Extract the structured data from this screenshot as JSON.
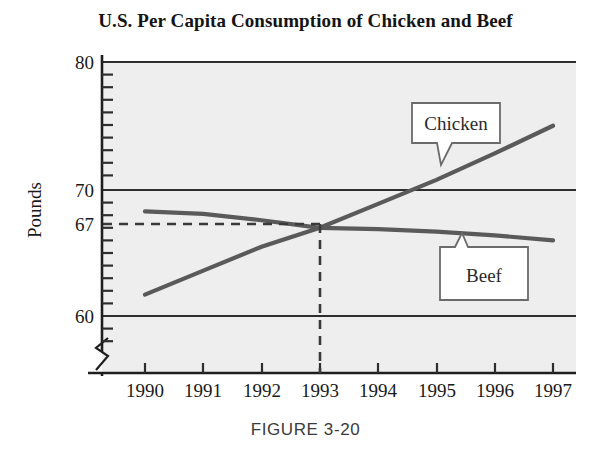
{
  "figure": {
    "title": "U.S. Per Capita Consumption of Chicken and Beef",
    "caption": "FIGURE 3-20"
  },
  "colors": {
    "line": "#5a5a5a",
    "axis": "#1f1f1f",
    "grid": "#3a3a3a",
    "plot_background": "#eeeeee",
    "callout_fill": "#ffffff",
    "callout_border": "#6b6b6b",
    "text": "#1a1a1a"
  },
  "chart_data": {
    "type": "line",
    "title": "U.S. Per Capita Consumption of Chicken and Beef",
    "xlabel": "",
    "ylabel": "Pounds",
    "x": [
      1990,
      1991,
      1992,
      1993,
      1994,
      1995,
      1996,
      1997
    ],
    "xticklabels": [
      "1990",
      "1991",
      "1992",
      "1993",
      "1994",
      "1995",
      "1996",
      "1997"
    ],
    "yticks": [
      60,
      67,
      70,
      80
    ],
    "yticklabels": [
      "60",
      "67",
      "70",
      "80"
    ],
    "ylim": [
      57,
      80
    ],
    "xlim": [
      1989.4,
      1997.6
    ],
    "grid": "horizontal",
    "gridlines": [
      60,
      70,
      80
    ],
    "minor_y_ticks": 1,
    "axis_break": true,
    "legend": "callouts",
    "series": [
      {
        "name": "Chicken",
        "values": [
          61.7,
          63.6,
          65.5,
          67.0,
          68.9,
          70.8,
          72.9,
          75.1
        ],
        "label_text": "Chicken"
      },
      {
        "name": "Beef",
        "values": [
          68.3,
          68.1,
          67.6,
          67.0,
          66.9,
          66.7,
          66.4,
          66.0
        ],
        "label_text": "Beef"
      }
    ],
    "annotations": [
      {
        "name": "intersection",
        "x": 1993,
        "y": 67,
        "style": "dashed-guidelines",
        "value_label": "67"
      }
    ]
  },
  "labels": {
    "chicken": "Chicken",
    "beef": "Beef",
    "y_axis_title": "Pounds",
    "y_80": "80",
    "y_70": "70",
    "y_67": "67",
    "y_60": "60",
    "x_1990": "1990",
    "x_1991": "1991",
    "x_1992": "1992",
    "x_1993": "1993",
    "x_1994": "1994",
    "x_1995": "1995",
    "x_1996": "1996",
    "x_1997": "1997"
  }
}
